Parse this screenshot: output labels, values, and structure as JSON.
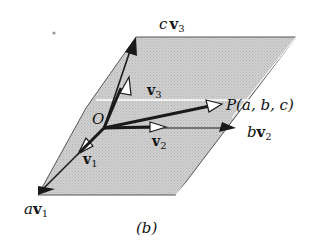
{
  "figure": {
    "caption": "(b)",
    "colors": {
      "plane_fill": "#c8c8c8",
      "plane_edge": "#555555",
      "highlight": "#ffffff",
      "vector": "#1a1a1a"
    },
    "points": {
      "origin": {
        "label": "O",
        "x": 104,
        "y": 128
      },
      "P": {
        "label": "P(a, b, c)",
        "x": 220,
        "y": 103
      }
    },
    "vectors": [
      {
        "name": "v1",
        "label": "v",
        "subscript": "1"
      },
      {
        "name": "v2",
        "label": "v",
        "subscript": "2"
      },
      {
        "name": "v3",
        "label": "v",
        "subscript": "3"
      }
    ],
    "scaled_vectors": [
      {
        "name": "a-v1",
        "coef": "a",
        "label": "v",
        "subscript": "1"
      },
      {
        "name": "b-v2",
        "coef": "b",
        "label": "v",
        "subscript": "2"
      },
      {
        "name": "c-v3",
        "coef": "c",
        "label": "v",
        "subscript": "3"
      }
    ],
    "stray_dot": {
      "x": 54,
      "y": 33
    }
  }
}
